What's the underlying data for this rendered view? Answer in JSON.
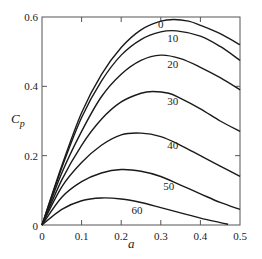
{
  "chart_data": {
    "type": "line",
    "title": "",
    "xlabel": "a",
    "ylabel": "Cp",
    "ylabel_main": "C",
    "ylabel_sub": "p",
    "xlim": [
      0,
      0.5
    ],
    "ylim": [
      0,
      0.6
    ],
    "grid": false,
    "legend": "inline curve labels",
    "xticks": [
      "0",
      "0.1",
      "0.2",
      "0.3",
      "0.4",
      "0.5"
    ],
    "yticks": [
      "0",
      "0.2",
      "0.4",
      "0.6"
    ],
    "series": [
      {
        "name": "0",
        "x": [
          0,
          0.05,
          0.1,
          0.15,
          0.2,
          0.25,
          0.3,
          0.333,
          0.37,
          0.4,
          0.45,
          0.5
        ],
        "values": [
          0,
          0.171,
          0.324,
          0.434,
          0.512,
          0.563,
          0.588,
          0.593,
          0.588,
          0.576,
          0.552,
          0.52
        ]
      },
      {
        "name": "10",
        "x": [
          0,
          0.05,
          0.1,
          0.15,
          0.2,
          0.25,
          0.3,
          0.34,
          0.4,
          0.45,
          0.5
        ],
        "values": [
          0,
          0.165,
          0.31,
          0.415,
          0.49,
          0.535,
          0.557,
          0.56,
          0.545,
          0.515,
          0.475
        ]
      },
      {
        "name": "20",
        "x": [
          0,
          0.05,
          0.1,
          0.15,
          0.2,
          0.25,
          0.3,
          0.35,
          0.4,
          0.45,
          0.5
        ],
        "values": [
          0,
          0.15,
          0.27,
          0.37,
          0.435,
          0.475,
          0.49,
          0.48,
          0.455,
          0.425,
          0.39
        ]
      },
      {
        "name": "30",
        "x": [
          0,
          0.05,
          0.1,
          0.15,
          0.2,
          0.25,
          0.28,
          0.32,
          0.35,
          0.4,
          0.45,
          0.5
        ],
        "values": [
          0,
          0.13,
          0.23,
          0.305,
          0.355,
          0.38,
          0.385,
          0.38,
          0.365,
          0.335,
          0.3,
          0.27
        ]
      },
      {
        "name": "40",
        "x": [
          0,
          0.05,
          0.1,
          0.15,
          0.2,
          0.25,
          0.3,
          0.35,
          0.4,
          0.45,
          0.5
        ],
        "values": [
          0,
          0.11,
          0.18,
          0.23,
          0.26,
          0.265,
          0.255,
          0.23,
          0.2,
          0.17,
          0.14
        ]
      },
      {
        "name": "50",
        "x": [
          0,
          0.05,
          0.1,
          0.15,
          0.2,
          0.25,
          0.3,
          0.35,
          0.4,
          0.45,
          0.5
        ],
        "values": [
          0,
          0.08,
          0.125,
          0.15,
          0.16,
          0.155,
          0.14,
          0.115,
          0.09,
          0.065,
          0.045
        ]
      },
      {
        "name": "60",
        "x": [
          0,
          0.05,
          0.1,
          0.15,
          0.2,
          0.25,
          0.3,
          0.35,
          0.4,
          0.45,
          0.47
        ],
        "values": [
          0,
          0.045,
          0.07,
          0.078,
          0.075,
          0.065,
          0.05,
          0.035,
          0.02,
          0.007,
          0.002
        ]
      }
    ],
    "annotations": [
      {
        "text": "0",
        "x": 0.3,
        "y": 0.568
      },
      {
        "text": "10",
        "x": 0.33,
        "y": 0.527
      },
      {
        "text": "20",
        "x": 0.33,
        "y": 0.453
      },
      {
        "text": "30",
        "x": 0.33,
        "y": 0.345
      },
      {
        "text": "40",
        "x": 0.33,
        "y": 0.219
      },
      {
        "text": "50",
        "x": 0.32,
        "y": 0.1
      },
      {
        "text": "60",
        "x": 0.24,
        "y": 0.033
      }
    ]
  }
}
